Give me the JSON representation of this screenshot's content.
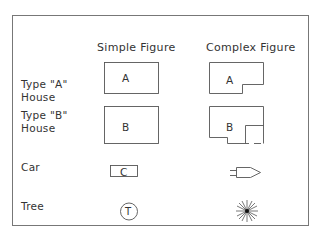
{
  "columns": {
    "simple": "Simple Figure",
    "complex": "Complex Figure"
  },
  "rows": [
    {
      "label_line1": "Type \"A\"",
      "label_line2": "House",
      "simple_letter": "A",
      "complex_letter": "A"
    },
    {
      "label_line1": "Type \"B\"",
      "label_line2": "House",
      "simple_letter": "B",
      "complex_letter": "B"
    },
    {
      "label_line1": "Car",
      "simple_letter": "C",
      "complex_icon": "car-outline-icon"
    },
    {
      "label_line1": "Tree",
      "simple_letter": "T",
      "complex_icon": "starburst-tree-icon"
    }
  ],
  "colors": {
    "line": "#555555",
    "text": "#333333",
    "frame": "#777777"
  }
}
